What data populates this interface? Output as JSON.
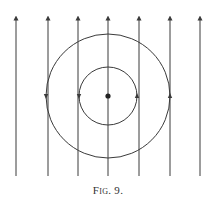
{
  "figure": {
    "caption": "Fig. 9.",
    "line_color": "#3a3a3a",
    "field_lines": {
      "x_positions": [
        16,
        48,
        78,
        108,
        139,
        170,
        200
      ],
      "y_top": 14,
      "y_bottom": 176,
      "arrow_direction": "up"
    },
    "circles": {
      "center": [
        108,
        96
      ],
      "radii": [
        29,
        62
      ],
      "arrow_direction": "counterclockwise",
      "center_dot": true
    }
  }
}
